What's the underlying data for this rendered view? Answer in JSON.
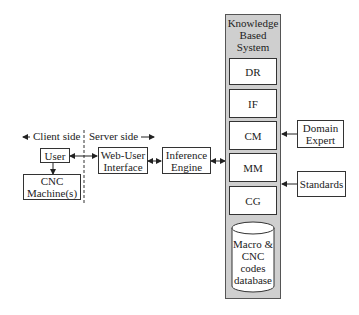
{
  "labels": {
    "client_side": "Client side",
    "server_side": "Server side"
  },
  "nodes": {
    "user": "User",
    "cnc_machines": "CNC Machine(s)",
    "web_user_interface_line1": "Web-User",
    "web_user_interface_line2": "Interface",
    "inference_engine_line1": "Inference",
    "inference_engine_line2": "Engine",
    "domain_expert_line1": "Domain",
    "domain_expert_line2": "Expert",
    "standards": "Standards"
  },
  "knowledge_based_system": {
    "title_line1": "Knowledge",
    "title_line2": "Based",
    "title_line3": "System",
    "modules": [
      "DR",
      "IF",
      "CM",
      "MM",
      "CG"
    ],
    "database": {
      "line1": "Macro &",
      "line2": "CNC",
      "line3": "codes",
      "line4": "database"
    }
  },
  "colors": {
    "kbs_fill": "#cfcfcf",
    "stroke": "#333333"
  }
}
